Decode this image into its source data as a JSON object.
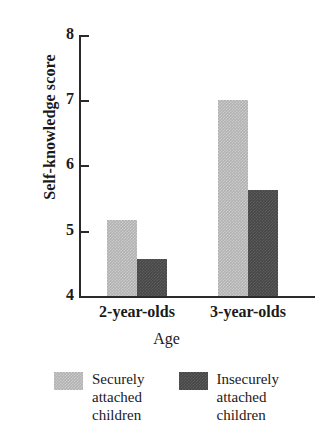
{
  "chart_data": {
    "type": "bar",
    "title": "",
    "xlabel": "Age",
    "ylabel": "Self-knowledge score",
    "categories": [
      "2-year-olds",
      "3-year-olds"
    ],
    "ylim": [
      4,
      8
    ],
    "yticks": [
      "4",
      "5",
      "6",
      "7",
      "8"
    ],
    "grid": false,
    "legend_position": "bottom",
    "series": [
      {
        "name": "Securely attached children",
        "color": "#b2b2b2",
        "values": [
          5.17,
          7.0
        ]
      },
      {
        "name": "Insecurely attached children",
        "color": "#474747",
        "values": [
          4.57,
          5.62
        ]
      }
    ]
  },
  "axis": {
    "y_title": "Self-knowledge score",
    "x_title": "Age",
    "y_ticks": [
      "8",
      "7",
      "6",
      "5",
      "4"
    ],
    "x_ticks": [
      "2-year-olds",
      "3-year-olds"
    ]
  },
  "legend": {
    "items": [
      {
        "label": "Securely\nattached\nchildren",
        "color": "#b2b2b2"
      },
      {
        "label": "Insecurely\nattached\nchildren",
        "color": "#474747"
      }
    ]
  }
}
